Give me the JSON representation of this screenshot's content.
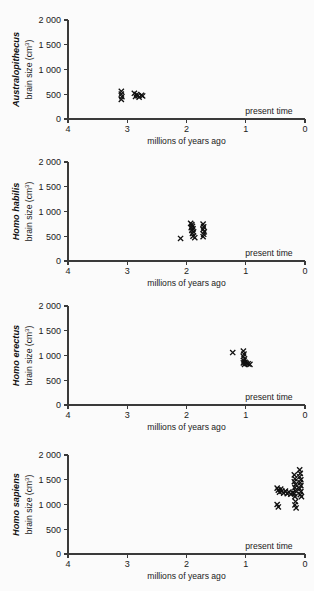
{
  "figure": {
    "width": 314,
    "height": 591,
    "background": "#fbfbfb",
    "marker_color": "#111111",
    "axis_color": "#3a3a3a"
  },
  "common": {
    "xlabel": "millions of years ago",
    "ylabel_main": "brain size (cm",
    "ylabel_sup": "3",
    "ylabel_close": ")",
    "present_time_label": "present time",
    "x_ticks": [
      "4",
      "3",
      "2",
      "1",
      "0"
    ],
    "x_tick_values": [
      4,
      3,
      2,
      1,
      0
    ],
    "y_ticks": [
      "0",
      "500",
      "1 000",
      "1 500",
      "2 000"
    ],
    "y_tick_values": [
      0,
      500,
      1000,
      1500,
      2000
    ],
    "xlim": [
      4,
      0
    ],
    "ylim": [
      0,
      2000
    ],
    "grid": false,
    "marker_symbol": "x"
  },
  "chart_data": [
    {
      "type": "scatter",
      "title": "Australopithecus",
      "species": "Australopithecus",
      "xlabel": "millions of years ago",
      "ylabel": "brain size (cm3)",
      "xlim": [
        4,
        0
      ],
      "ylim": [
        0,
        2000
      ],
      "grid": false,
      "legend": "none",
      "annotations": [
        "present time"
      ],
      "points": [
        {
          "x": 3.1,
          "y": 560
        },
        {
          "x": 3.1,
          "y": 505
        },
        {
          "x": 3.09,
          "y": 450
        },
        {
          "x": 3.1,
          "y": 395
        },
        {
          "x": 2.88,
          "y": 520
        },
        {
          "x": 2.84,
          "y": 495
        },
        {
          "x": 2.82,
          "y": 470
        },
        {
          "x": 2.86,
          "y": 455
        },
        {
          "x": 2.8,
          "y": 440
        },
        {
          "x": 2.76,
          "y": 480
        },
        {
          "x": 2.74,
          "y": 465
        }
      ]
    },
    {
      "type": "scatter",
      "title": "Homo habilis",
      "species": "Homo habilis",
      "xlabel": "millions of years ago",
      "ylabel": "brain size (cm3)",
      "xlim": [
        4,
        0
      ],
      "ylim": [
        0,
        2000
      ],
      "grid": false,
      "legend": "none",
      "annotations": [
        "present time"
      ],
      "points": [
        {
          "x": 2.1,
          "y": 455
        },
        {
          "x": 1.93,
          "y": 760
        },
        {
          "x": 1.91,
          "y": 735
        },
        {
          "x": 1.9,
          "y": 700
        },
        {
          "x": 1.92,
          "y": 675
        },
        {
          "x": 1.89,
          "y": 650
        },
        {
          "x": 1.91,
          "y": 620
        },
        {
          "x": 1.88,
          "y": 590
        },
        {
          "x": 1.9,
          "y": 555
        },
        {
          "x": 1.89,
          "y": 500
        },
        {
          "x": 1.86,
          "y": 470
        },
        {
          "x": 1.72,
          "y": 745
        },
        {
          "x": 1.71,
          "y": 690
        },
        {
          "x": 1.72,
          "y": 640
        },
        {
          "x": 1.7,
          "y": 590
        },
        {
          "x": 1.71,
          "y": 540
        },
        {
          "x": 1.72,
          "y": 490
        }
      ]
    },
    {
      "type": "scatter",
      "title": "Homo erectus",
      "species": "Homo erectus",
      "xlabel": "millions of years ago",
      "ylabel": "brain size (cm3)",
      "xlim": [
        4,
        0
      ],
      "ylim": [
        0,
        2000
      ],
      "grid": false,
      "legend": "none",
      "annotations": [
        "present time"
      ],
      "points": [
        {
          "x": 1.22,
          "y": 1060
        },
        {
          "x": 1.04,
          "y": 1090
        },
        {
          "x": 1.03,
          "y": 1030
        },
        {
          "x": 1.04,
          "y": 980
        },
        {
          "x": 1.02,
          "y": 930
        },
        {
          "x": 1.03,
          "y": 890
        },
        {
          "x": 1.01,
          "y": 860
        },
        {
          "x": 1.04,
          "y": 850
        },
        {
          "x": 0.99,
          "y": 840
        },
        {
          "x": 1.02,
          "y": 820
        },
        {
          "x": 0.96,
          "y": 830
        },
        {
          "x": 0.93,
          "y": 820
        }
      ]
    },
    {
      "type": "scatter",
      "title": "Homo sapiens",
      "species": "Homo sapiens",
      "xlabel": "millions of years ago",
      "ylabel": "brain size (cm3)",
      "xlim": [
        4,
        0
      ],
      "ylim": [
        0,
        2000
      ],
      "grid": false,
      "legend": "none",
      "annotations": [
        "present time"
      ],
      "points": [
        {
          "x": 0.47,
          "y": 1330
        },
        {
          "x": 0.45,
          "y": 1290
        },
        {
          "x": 0.43,
          "y": 1250
        },
        {
          "x": 0.41,
          "y": 1310
        },
        {
          "x": 0.39,
          "y": 1270
        },
        {
          "x": 0.47,
          "y": 1000
        },
        {
          "x": 0.45,
          "y": 950
        },
        {
          "x": 0.36,
          "y": 1230
        },
        {
          "x": 0.33,
          "y": 1270
        },
        {
          "x": 0.3,
          "y": 1220
        },
        {
          "x": 0.27,
          "y": 1250
        },
        {
          "x": 0.24,
          "y": 1210
        },
        {
          "x": 0.21,
          "y": 1240
        },
        {
          "x": 0.18,
          "y": 1600
        },
        {
          "x": 0.17,
          "y": 1520
        },
        {
          "x": 0.18,
          "y": 1460
        },
        {
          "x": 0.16,
          "y": 1400
        },
        {
          "x": 0.17,
          "y": 1340
        },
        {
          "x": 0.16,
          "y": 1280
        },
        {
          "x": 0.18,
          "y": 1220
        },
        {
          "x": 0.17,
          "y": 1160
        },
        {
          "x": 0.16,
          "y": 1060
        },
        {
          "x": 0.17,
          "y": 990
        },
        {
          "x": 0.15,
          "y": 930
        },
        {
          "x": 0.09,
          "y": 1700
        },
        {
          "x": 0.08,
          "y": 1630
        },
        {
          "x": 0.09,
          "y": 1560
        },
        {
          "x": 0.07,
          "y": 1500
        },
        {
          "x": 0.08,
          "y": 1440
        },
        {
          "x": 0.07,
          "y": 1380
        },
        {
          "x": 0.09,
          "y": 1320
        },
        {
          "x": 0.07,
          "y": 1260
        },
        {
          "x": 0.08,
          "y": 1200
        },
        {
          "x": 0.06,
          "y": 1160
        }
      ]
    }
  ]
}
